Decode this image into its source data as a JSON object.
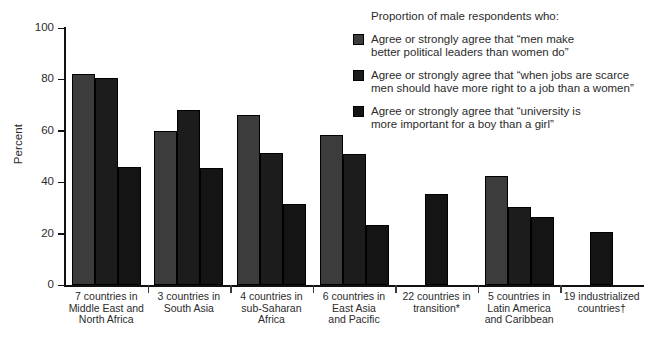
{
  "chart_data": {
    "type": "bar",
    "title": "",
    "subtitle": "",
    "xlabel": "",
    "ylabel": "Percent",
    "ylim": [
      0,
      100
    ],
    "yticks": [
      0,
      20,
      40,
      60,
      80,
      100
    ],
    "grid": false,
    "legend_position": "top-right",
    "legend_title": "Proportion of male respondents who:",
    "categories": [
      "7 countries in Middle East and North Africa",
      "3 countries in South Asia",
      "4 countries in sub-Saharan Africa",
      "6 countries in East Asia and Pacific",
      "22 countries in transition*",
      "5 countries in Latin America and Caribbean",
      "19 industrialized countries†"
    ],
    "series": [
      {
        "name": "Agree or strongly agree that “men make better political leaders than women do”",
        "color": "#3c3c3c",
        "values": [
          82,
          60,
          66,
          58.5,
          null,
          42.5,
          null
        ]
      },
      {
        "name": "Agree or strongly agree that “when jobs are scarce men should have more right to a job than a women”",
        "color": "#1c1c1c",
        "values": [
          80.5,
          68,
          51.5,
          51,
          null,
          30.5,
          null
        ]
      },
      {
        "name": "Agree or strongly agree that “university is more important for a boy than a girl”",
        "color": "#141414",
        "values": [
          46,
          45.5,
          31.5,
          23.5,
          35.5,
          26.5,
          20.5
        ]
      }
    ]
  },
  "axis": {
    "y_title": "Percent",
    "y_tick_labels": [
      "100",
      "80",
      "60",
      "40",
      "20",
      "0"
    ]
  },
  "categories_lines": [
    [
      "7 countries in",
      "Middle East and",
      "North Africa"
    ],
    [
      "3 countries in",
      "South Asia"
    ],
    [
      "4 countries in",
      "sub-Saharan",
      "Africa"
    ],
    [
      "6 countries in",
      "East Asia",
      "and Pacific"
    ],
    [
      "22 countries in",
      "transition*"
    ],
    [
      "5 countries in",
      "Latin America",
      "and Caribbean"
    ],
    [
      "19 industrialized",
      "countries†"
    ]
  ],
  "legend": {
    "title": "Proportion of male respondents who:",
    "items": [
      {
        "lines": [
          "Agree or strongly agree that “men make",
          "better political leaders than women do”"
        ],
        "color": "#3c3c3c"
      },
      {
        "lines": [
          "Agree or strongly agree that “when jobs are scarce",
          "men should have more right to a job than a women”"
        ],
        "color": "#1c1c1c"
      },
      {
        "lines": [
          "Agree or strongly agree that “university is",
          "more important for a boy than a girl”"
        ],
        "color": "#141414"
      }
    ]
  }
}
